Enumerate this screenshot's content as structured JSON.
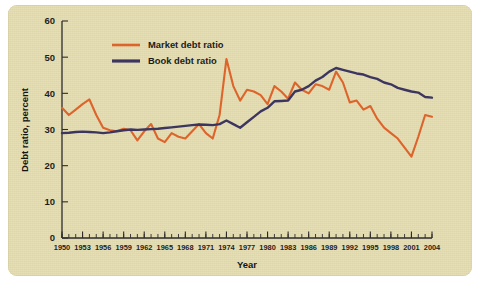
{
  "figure": {
    "background_color": "#e6dfb5",
    "page_color": "#ffffff"
  },
  "chart_data": {
    "type": "line",
    "title": "",
    "xlabel": "Year",
    "ylabel": "Debt ratio, percent",
    "xlim": [
      1950,
      2004
    ],
    "ylim": [
      0,
      60
    ],
    "ytick_values": [
      0,
      10,
      20,
      30,
      40,
      50,
      60
    ],
    "ytick_labels": [
      "0",
      "10",
      "20",
      "30",
      "40",
      "50",
      "60"
    ],
    "xtick_values": [
      1950,
      1953,
      1956,
      1959,
      1962,
      1965,
      1968,
      1971,
      1974,
      1977,
      1980,
      1983,
      1986,
      1989,
      1992,
      1995,
      1998,
      2001,
      2004
    ],
    "xtick_labels": [
      "1950",
      "1953",
      "1956",
      "1959",
      "1962",
      "1965",
      "1968",
      "1971",
      "1974",
      "1977",
      "1980",
      "1983",
      "1986",
      "1989",
      "1992",
      "1995",
      "1998",
      "2001",
      "2004"
    ],
    "minor_xtick_interval": 1,
    "grid": false,
    "legend_position": "upper-left-inside",
    "x": [
      1950,
      1951,
      1952,
      1953,
      1954,
      1955,
      1956,
      1957,
      1958,
      1959,
      1960,
      1961,
      1962,
      1963,
      1964,
      1965,
      1966,
      1967,
      1968,
      1969,
      1970,
      1971,
      1972,
      1973,
      1974,
      1975,
      1976,
      1977,
      1978,
      1979,
      1980,
      1981,
      1982,
      1983,
      1984,
      1985,
      1986,
      1987,
      1988,
      1989,
      1990,
      1991,
      1992,
      1993,
      1994,
      1995,
      1996,
      1997,
      1998,
      1999,
      2000,
      2001,
      2002,
      2003,
      2004
    ],
    "series": [
      {
        "name": "Market debt ratio",
        "color": "#e0652b",
        "values": [
          36.0,
          34.0,
          35.5,
          37.0,
          38.3,
          34.0,
          30.5,
          29.8,
          29.5,
          30.2,
          29.8,
          27.0,
          29.5,
          31.5,
          27.5,
          26.5,
          29.0,
          28.0,
          27.5,
          29.5,
          31.5,
          29.0,
          27.5,
          34.0,
          49.5,
          42.0,
          38.0,
          41.0,
          40.5,
          39.5,
          37.0,
          42.0,
          40.5,
          38.5,
          43.0,
          41.0,
          40.0,
          42.5,
          42.0,
          41.0,
          46.0,
          43.0,
          37.5,
          38.0,
          35.5,
          36.5,
          33.0,
          30.5,
          29.0,
          27.5,
          25.0,
          22.5,
          28.0,
          34.0,
          33.5
        ]
      },
      {
        "name": "Book debt ratio",
        "color": "#3a3560",
        "values": [
          29.0,
          29.1,
          29.3,
          29.4,
          29.3,
          29.2,
          29.0,
          29.2,
          29.5,
          29.8,
          30.0,
          29.9,
          30.0,
          30.1,
          30.2,
          30.4,
          30.6,
          30.8,
          31.0,
          31.2,
          31.4,
          31.3,
          31.2,
          31.5,
          32.5,
          31.5,
          30.5,
          32.0,
          33.5,
          35.0,
          36.0,
          37.8,
          37.9,
          38.0,
          40.5,
          41.0,
          42.0,
          43.5,
          44.5,
          46.0,
          47.0,
          46.5,
          46.0,
          45.5,
          45.2,
          44.5,
          44.0,
          43.0,
          42.5,
          41.5,
          41.0,
          40.5,
          40.2,
          39.0,
          38.8
        ]
      }
    ]
  }
}
